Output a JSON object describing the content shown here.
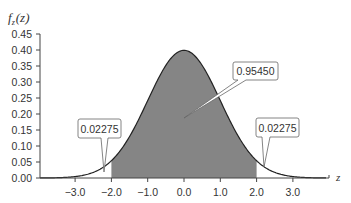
{
  "chart_data": {
    "type": "area",
    "title": "",
    "xlabel": "z",
    "ylabel": "f_z(z)",
    "ylabel_main": "f",
    "ylabel_sub": "z",
    "ylabel_arg": "(z)",
    "distribution": "standard normal",
    "xlim": [
      -4.0,
      4.0
    ],
    "ylim": [
      0.0,
      0.45
    ],
    "x_ticks": [
      "−3.0",
      "−2.0",
      "−1.0",
      "0.0",
      "1.0",
      "2.0",
      "3.0"
    ],
    "x_tick_values": [
      -3.0,
      -2.0,
      -1.0,
      0.0,
      1.0,
      2.0,
      3.0
    ],
    "y_ticks": [
      "0.00",
      "0.05",
      "0.10",
      "0.15",
      "0.20",
      "0.25",
      "0.30",
      "0.35",
      "0.40",
      "0.45"
    ],
    "y_tick_values": [
      0.0,
      0.05,
      0.1,
      0.15,
      0.2,
      0.25,
      0.3,
      0.35,
      0.4,
      0.45
    ],
    "shaded_region": [
      -2.0,
      2.0
    ],
    "grid": false,
    "annotations": [
      {
        "text": "0.02275",
        "region": "left tail",
        "x_range": [
          null,
          -2.0
        ],
        "value": 0.02275
      },
      {
        "text": "0.95450",
        "region": "center",
        "x_range": [
          -2.0,
          2.0
        ],
        "value": 0.9545
      },
      {
        "text": "0.02275",
        "region": "right tail",
        "x_range": [
          2.0,
          null
        ],
        "value": 0.02275
      }
    ],
    "colors": {
      "fill": "#858585",
      "curve": "#222222",
      "axis": "#444444"
    }
  }
}
